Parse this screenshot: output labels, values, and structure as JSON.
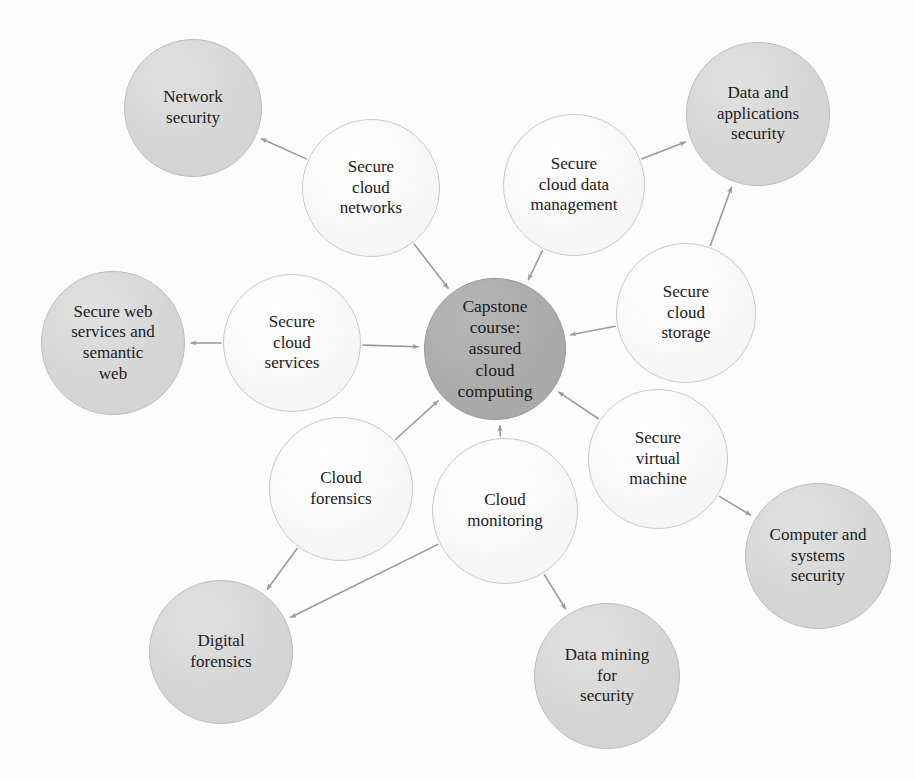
{
  "diagram": {
    "title": "Capstone course: assured cloud computing",
    "type": "node-link hub-and-spoke diagram",
    "background_color": "#fdfdfd",
    "palette": {
      "hub_fill": "#a9a9a9",
      "shaded_fill": "#d4d4d4",
      "plain_fill": "#f8f8f8",
      "node_border": "#c2c2c2",
      "edge_color": "#9b9b9b",
      "text_color": "#1b1b1b"
    },
    "nodes": [
      {
        "id": "hub",
        "label": "Capstone\ncourse:\nassured\ncloud\ncomputing",
        "style": "hub",
        "cx": 495,
        "cy": 349,
        "r": 71
      },
      {
        "id": "network-security",
        "label": "Network\nsecurity",
        "style": "shaded",
        "cx": 193,
        "cy": 108,
        "r": 69
      },
      {
        "id": "secure-cloud-networks",
        "label": "Secure\ncloud\nnetworks",
        "style": "plain",
        "cx": 371,
        "cy": 188,
        "r": 69
      },
      {
        "id": "secure-cloud-data-management",
        "label": "Secure\ncloud data\nmanagement",
        "style": "plain",
        "cx": 574,
        "cy": 185,
        "r": 71
      },
      {
        "id": "data-and-applications-security",
        "label": "Data and\napplications\nsecurity",
        "style": "shaded",
        "cx": 758,
        "cy": 114,
        "r": 72
      },
      {
        "id": "secure-cloud-storage",
        "label": "Secure\ncloud\nstorage",
        "style": "plain",
        "cx": 686,
        "cy": 313,
        "r": 70
      },
      {
        "id": "secure-web-services-and-semantic-web",
        "label": "Secure web\nservices and\nsemantic\nweb",
        "style": "shaded",
        "cx": 113,
        "cy": 343,
        "r": 72
      },
      {
        "id": "secure-cloud-services",
        "label": "Secure\ncloud\nservices",
        "style": "plain",
        "cx": 292,
        "cy": 343,
        "r": 69
      },
      {
        "id": "cloud-forensics",
        "label": "Cloud\nforensics",
        "style": "plain",
        "cx": 341,
        "cy": 489,
        "r": 72
      },
      {
        "id": "cloud-monitoring",
        "label": "Cloud\nmonitoring",
        "style": "plain",
        "cx": 505,
        "cy": 511,
        "r": 73
      },
      {
        "id": "secure-virtual-machine",
        "label": "Secure\nvirtual\nmachine",
        "style": "plain",
        "cx": 658,
        "cy": 459,
        "r": 70
      },
      {
        "id": "computer-and-systems-security",
        "label": "Computer and\nsystems\nsecurity",
        "style": "shaded",
        "cx": 818,
        "cy": 556,
        "r": 73
      },
      {
        "id": "digital-forensics",
        "label": "Digital\nforensics",
        "style": "shaded",
        "cx": 221,
        "cy": 652,
        "r": 72
      },
      {
        "id": "data-mining-for-security",
        "label": "Data mining\nfor\nsecurity",
        "style": "shaded",
        "cx": 607,
        "cy": 676,
        "r": 73
      }
    ],
    "edges": [
      {
        "from": "secure-cloud-networks",
        "to": "network-security",
        "directed": true
      },
      {
        "from": "secure-cloud-networks",
        "to": "hub",
        "directed": true
      },
      {
        "from": "secure-cloud-data-management",
        "to": "data-and-applications-security",
        "directed": true
      },
      {
        "from": "secure-cloud-data-management",
        "to": "hub",
        "directed": true
      },
      {
        "from": "secure-cloud-storage",
        "to": "data-and-applications-security",
        "directed": true
      },
      {
        "from": "secure-cloud-storage",
        "to": "hub",
        "directed": true
      },
      {
        "from": "secure-cloud-services",
        "to": "secure-web-services-and-semantic-web",
        "directed": true
      },
      {
        "from": "secure-cloud-services",
        "to": "hub",
        "directed": true
      },
      {
        "from": "cloud-forensics",
        "to": "hub",
        "directed": true
      },
      {
        "from": "cloud-forensics",
        "to": "digital-forensics",
        "directed": true
      },
      {
        "from": "cloud-monitoring",
        "to": "hub",
        "directed": true
      },
      {
        "from": "cloud-monitoring",
        "to": "digital-forensics",
        "directed": true
      },
      {
        "from": "cloud-monitoring",
        "to": "data-mining-for-security",
        "directed": true
      },
      {
        "from": "secure-virtual-machine",
        "to": "hub",
        "directed": true
      },
      {
        "from": "secure-virtual-machine",
        "to": "computer-and-systems-security",
        "directed": true
      }
    ]
  }
}
